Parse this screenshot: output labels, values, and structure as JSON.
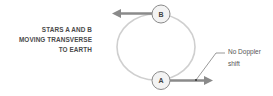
{
  "title": {
    "lines": [
      "STARS A AND B",
      "MOVING TRANSVERSE",
      "TO EARTH"
    ]
  },
  "stars": {
    "a": {
      "label": "A"
    },
    "b": {
      "label": "B"
    }
  },
  "annotation": {
    "line1": "No Doppler",
    "line2": "shift"
  },
  "colors": {
    "orbit": "#c8c8c8",
    "arrow": "#7f7f7f",
    "text": "#4a4a4a",
    "star_fill": "#f2f2f2",
    "star_stroke": "#888888"
  }
}
